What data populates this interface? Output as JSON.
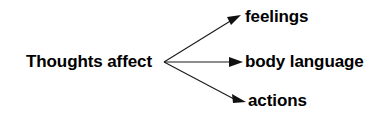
{
  "diagram": {
    "type": "node-link",
    "background_color": "#ffffff",
    "line_color": "#1a1a1a",
    "text_color": "#000000",
    "source": {
      "id": "thoughts-affect",
      "label": "Thoughts affect"
    },
    "targets": [
      {
        "id": "feelings",
        "label": "feelings"
      },
      {
        "id": "body-language",
        "label": "body language"
      },
      {
        "id": "actions",
        "label": "actions"
      }
    ],
    "edges": [
      {
        "from": "thoughts-affect",
        "to": "feelings",
        "arrowhead": "solid-triangle"
      },
      {
        "from": "thoughts-affect",
        "to": "body-language",
        "arrowhead": "solid-triangle"
      },
      {
        "from": "thoughts-affect",
        "to": "actions",
        "arrowhead": "solid-triangle"
      }
    ]
  }
}
